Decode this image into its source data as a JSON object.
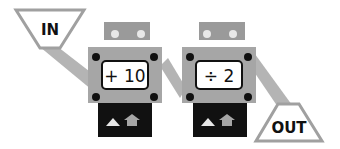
{
  "diagram": {
    "input_label": "IN",
    "output_label": "OUT",
    "machines": [
      {
        "operation": "+ 10",
        "controls": [
          "triangle-up",
          "house-arrow-up"
        ]
      },
      {
        "operation": "÷ 2",
        "controls": [
          "triangle-up",
          "house-arrow-up"
        ]
      }
    ],
    "colors": {
      "band": "#b4b4b4",
      "machine_body": "#a6a6a6",
      "machine_top": "#9a9a9a",
      "display_bg": "#ffffff",
      "base": "#111111",
      "bolt": "#111111",
      "light": "#e8e8e8"
    }
  }
}
